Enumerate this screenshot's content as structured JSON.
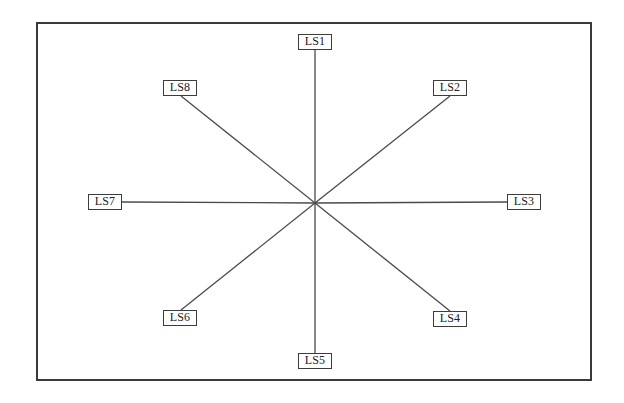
{
  "diagram": {
    "type": "star",
    "center": {
      "x": 315,
      "y": 203
    },
    "line_color": "#4a4a4a",
    "frame_color": "#3a3a3a",
    "nodes": [
      {
        "id": "LS1",
        "label": "LS1",
        "x": 298,
        "y": 34,
        "anchor": {
          "x": 315,
          "y": 50
        }
      },
      {
        "id": "LS2",
        "label": "LS2",
        "x": 433,
        "y": 80,
        "anchor": {
          "x": 450,
          "y": 96
        }
      },
      {
        "id": "LS3",
        "label": "LS3",
        "x": 507,
        "y": 194,
        "anchor": {
          "x": 507,
          "y": 202
        }
      },
      {
        "id": "LS4",
        "label": "LS4",
        "x": 433,
        "y": 311,
        "anchor": {
          "x": 450,
          "y": 311
        }
      },
      {
        "id": "LS5",
        "label": "LS5",
        "x": 298,
        "y": 353,
        "anchor": {
          "x": 315,
          "y": 353
        }
      },
      {
        "id": "LS6",
        "label": "LS6",
        "x": 163,
        "y": 310,
        "anchor": {
          "x": 181,
          "y": 310
        }
      },
      {
        "id": "LS7",
        "label": "LS7",
        "x": 88,
        "y": 194,
        "anchor": {
          "x": 122,
          "y": 202
        }
      },
      {
        "id": "LS8",
        "label": "LS8",
        "x": 163,
        "y": 80,
        "anchor": {
          "x": 181,
          "y": 96
        }
      }
    ],
    "edges": [
      {
        "from": "center",
        "to": "LS1"
      },
      {
        "from": "center",
        "to": "LS2"
      },
      {
        "from": "center",
        "to": "LS3"
      },
      {
        "from": "center",
        "to": "LS4"
      },
      {
        "from": "center",
        "to": "LS5"
      },
      {
        "from": "center",
        "to": "LS6"
      },
      {
        "from": "center",
        "to": "LS7"
      },
      {
        "from": "center",
        "to": "LS8"
      }
    ]
  }
}
